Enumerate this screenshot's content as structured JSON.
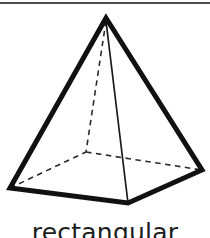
{
  "figure": {
    "caption": "rectangular",
    "shape_name": "rectangular-pyramid",
    "colors": {
      "background": "#ffffff",
      "stroke": "#111111",
      "hidden_stroke": "#2b2b2b",
      "caption": "#1c1c1c",
      "top_rule": "#4a4a4d"
    },
    "geometry": {
      "apex": [
        106,
        18
      ],
      "base_left": [
        10,
        188
      ],
      "base_front": [
        128,
        203
      ],
      "base_right": [
        202,
        170
      ],
      "base_back_hidden": [
        86,
        152
      ]
    },
    "edges": {
      "visible_thick": [
        "apex-to-base-left",
        "apex-to-base-right",
        "base-left-to-base-front",
        "base-front-to-base-right"
      ],
      "visible_thin": [
        "apex-to-base-front"
      ],
      "hidden_dashed": [
        "base-left-to-base-back",
        "base-back-to-base-right",
        "apex-to-base-back"
      ]
    }
  }
}
